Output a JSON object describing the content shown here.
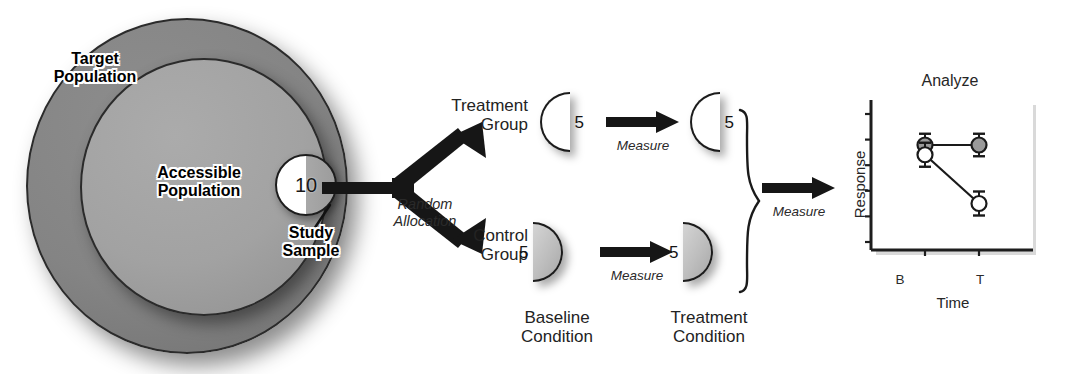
{
  "population": {
    "target_label": "Target\nPopulation",
    "accessible_label": "Accessible\nPopulation",
    "sample_label": "Study\nSample",
    "sample_count": "10"
  },
  "allocation": {
    "caption": "Random\nAllocation"
  },
  "groups": {
    "treatment_label": "Treatment\nGroup",
    "control_label": "Control\nGroup",
    "treatment_baseline_count": "5",
    "treatment_treated_count": "5",
    "control_baseline_count": "5",
    "control_treated_count": "5"
  },
  "measures": {
    "top_label": "Measure",
    "bottom_label": "Measure",
    "right_label": "Measure"
  },
  "conditions": {
    "baseline_label": "Baseline\nCondition",
    "treatment_label": "Treatment\nCondition"
  },
  "colors": {
    "target_population_fill": "#848484",
    "accessible_population_fill": "#a2a2a2",
    "study_sample_fill_left": "#ffffff",
    "study_sample_fill_right": "#a2a2a2",
    "group_grey_fill": "#bdbdbd",
    "group_white_fill": "#ffffff",
    "arrow_fill": "#161616",
    "outline": "#1c1c1c",
    "control_marker_fill": "#9a9a9a",
    "treatment_marker_fill": "#ffffff"
  },
  "chart_data": {
    "type": "line",
    "title": "Analyze",
    "xlabel": "Time",
    "ylabel": "Response",
    "categories": [
      "B",
      "T"
    ],
    "x_tick_labels": [
      "B",
      "T"
    ],
    "y_tick_labels": [],
    "y_tick_count": 6,
    "ylim": [
      0,
      10
    ],
    "xlim": [
      0,
      2
    ],
    "grid": false,
    "legend": false,
    "series": [
      {
        "name": "Control Group",
        "marker": "filled-circle",
        "marker_fill": "#9a9a9a",
        "values": [
          7.0,
          7.0
        ],
        "errors": [
          0.75,
          0.75
        ]
      },
      {
        "name": "Treatment Group",
        "marker": "open-circle",
        "marker_fill": "#ffffff",
        "values": [
          6.35,
          3.1
        ],
        "errors": [
          0.8,
          0.8
        ]
      }
    ]
  }
}
